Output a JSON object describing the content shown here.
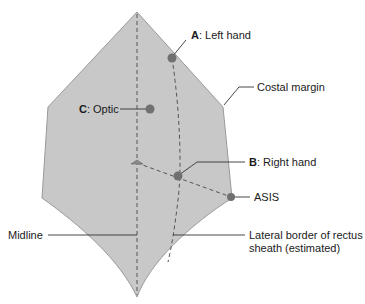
{
  "diagram": {
    "colors": {
      "abdomen_fill": "#c8c8c8",
      "abdomen_stroke": "#9a9a9a",
      "dashed_line": "#555555",
      "port_dot": "#707070",
      "leader_line": "#333333",
      "text": "#1a1a1a"
    },
    "ports": [
      {
        "id": "A",
        "letter": "A",
        "label": ": Left hand"
      },
      {
        "id": "C",
        "letter": "C",
        "label": ": Optic"
      },
      {
        "id": "B",
        "letter": "B",
        "label": ": Right hand"
      }
    ],
    "landmarks": {
      "asis": "ASIS",
      "costal_margin": "Costal margin",
      "midline": "Midline",
      "lateral_border_line1": "Lateral border of rectus",
      "lateral_border_line2": "sheath (estimated)"
    }
  }
}
